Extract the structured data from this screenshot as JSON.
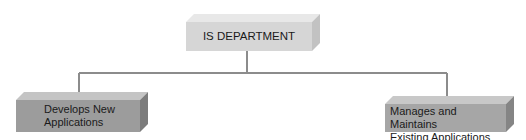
{
  "diagram": {
    "root": {
      "label": "IS DEPARTMENT"
    },
    "children": [
      {
        "label_line1": "Develops New",
        "label_line2": "Applications"
      },
      {
        "label_line1": "Manages and Maintains",
        "label_line2": "Existing Applications"
      }
    ],
    "colors": {
      "root_front": "#d6d6d6",
      "root_top": "#e8e8e8",
      "root_side": "#c2c2c2",
      "child_front": "#9c9c9c",
      "child_top": "#c4c4c4",
      "child_side": "#7c7c7c",
      "connector": "#8c8c8c"
    }
  }
}
